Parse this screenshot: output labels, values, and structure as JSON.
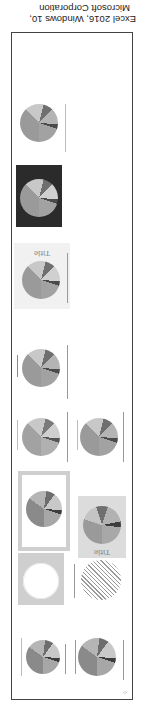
{
  "caption": {
    "line1": "Excel 2016, Windows 10,",
    "line2": "Microsoft Corporation"
  },
  "gallery": {
    "title": "Pie chart styles gallery",
    "orientation": "rotated 180 degrees",
    "corner_glyph": "⁘",
    "thumbnails": [
      {
        "id": "style-1",
        "variant": "plain-pie-with-legend"
      },
      {
        "id": "style-2",
        "variant": "plain-pie-with-legend-alt"
      },
      {
        "id": "style-3",
        "variant": "pie-with-title-and-labels-grey-bg",
        "title": "Title"
      },
      {
        "id": "style-4",
        "variant": "pie-with-grey-border-frame"
      },
      {
        "id": "style-5",
        "variant": "hatched-pie"
      },
      {
        "id": "style-6",
        "variant": "white-slices-on-grey"
      },
      {
        "id": "style-7",
        "variant": "plain-pie-left"
      },
      {
        "id": "style-8",
        "variant": "plain-pie-right"
      },
      {
        "id": "style-9",
        "variant": "plain-pie-single"
      },
      {
        "id": "style-10",
        "variant": "textured-pie-with-title",
        "title": "Title"
      },
      {
        "id": "style-11",
        "variant": "dark-background-pie"
      },
      {
        "id": "style-12",
        "variant": "small-pie-with-legend"
      }
    ]
  },
  "colors": {
    "frame": "#444444",
    "slice_dark": "#6f6f6f",
    "slice_mid": "#9a9a9a",
    "slice_light": "#c4c4c4",
    "slice_lighter": "#d8d8d8",
    "dark_bg": "#2b2b2b",
    "grey_bg": "#cfcfcf"
  }
}
